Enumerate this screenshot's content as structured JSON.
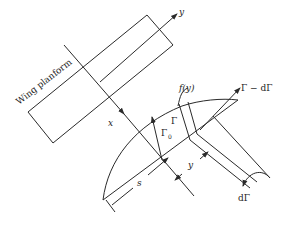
{
  "diagram": {
    "labels": {
      "wing_planform": "Wing planform",
      "x_axis": "x",
      "y_axis": "y",
      "distribution": "f(y)",
      "gamma": "Γ",
      "gamma0": "Γ",
      "gamma0_sub": "0",
      "gamma_minus": "Γ − dΓ",
      "s": "s",
      "y_dim": "y",
      "d_gamma": "dΓ"
    },
    "colors": {
      "line": "#2a2a2a",
      "background": "#ffffff"
    }
  }
}
